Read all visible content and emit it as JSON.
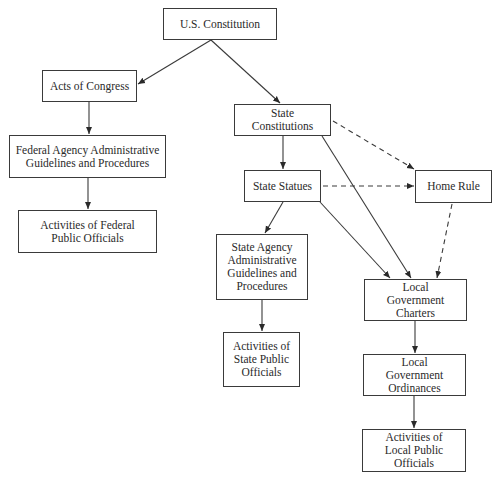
{
  "diagram": {
    "type": "hierarchy-flowchart",
    "nodes": {
      "us_constitution": {
        "label": "U.S. Constitution"
      },
      "acts_of_congress": {
        "label": "Acts of Congress"
      },
      "federal_agency": {
        "label": "Federal Agency Administrative Guidelines and Procedures"
      },
      "federal_officials": {
        "label": "Activities of Federal Public Officials"
      },
      "state_constitutions": {
        "label": "State Constitutions"
      },
      "state_statues": {
        "label": "State Statues"
      },
      "home_rule": {
        "label": "Home Rule"
      },
      "state_agency": {
        "label": "State Agency Administrative Guidelines and Procedures"
      },
      "state_officials": {
        "label": "Activities of State Public Officials"
      },
      "local_charters": {
        "label": "Local Government Charters"
      },
      "local_ordinances": {
        "label": "Local Government Ordinances"
      },
      "local_officials": {
        "label": "Activities of Local Public Officials"
      }
    },
    "edges": [
      {
        "from": "us_constitution",
        "to": "acts_of_congress",
        "style": "solid"
      },
      {
        "from": "us_constitution",
        "to": "state_constitutions",
        "style": "solid"
      },
      {
        "from": "acts_of_congress",
        "to": "federal_agency",
        "style": "solid"
      },
      {
        "from": "federal_agency",
        "to": "federal_officials",
        "style": "solid"
      },
      {
        "from": "state_constitutions",
        "to": "state_statues",
        "style": "solid"
      },
      {
        "from": "state_constitutions",
        "to": "home_rule",
        "style": "dashed"
      },
      {
        "from": "state_constitutions",
        "to": "local_charters",
        "style": "solid"
      },
      {
        "from": "state_statues",
        "to": "home_rule",
        "style": "dashed"
      },
      {
        "from": "state_statues",
        "to": "state_agency",
        "style": "solid"
      },
      {
        "from": "state_statues",
        "to": "local_charters",
        "style": "solid"
      },
      {
        "from": "home_rule",
        "to": "local_charters",
        "style": "dashed"
      },
      {
        "from": "state_agency",
        "to": "state_officials",
        "style": "solid"
      },
      {
        "from": "local_charters",
        "to": "local_ordinances",
        "style": "solid"
      },
      {
        "from": "local_ordinances",
        "to": "local_officials",
        "style": "solid"
      }
    ]
  }
}
